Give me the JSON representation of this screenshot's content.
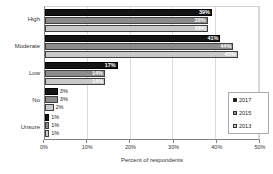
{
  "chart_data": {
    "type": "bar",
    "orientation": "horizontal",
    "title": "",
    "xlabel": "Percent of respondents",
    "ylabel": "",
    "xlim": [
      0,
      50
    ],
    "xticks": [
      "0%",
      "10%",
      "20%",
      "30%",
      "40%",
      "50%"
    ],
    "grid": true,
    "legend_position": "right",
    "value_suffix": "%",
    "inside_label_threshold": 6,
    "categories": [
      "High",
      "Moderate",
      "Low",
      "No",
      "Unsure"
    ],
    "series": [
      {
        "name": "2017",
        "color": "#141414",
        "border": "#000000",
        "label_color": "#ffffff",
        "values": [
          39,
          41,
          17,
          3,
          1
        ]
      },
      {
        "name": "2015",
        "color": "#8c8c8c",
        "border": "#3f3f3f",
        "label_color": "#ffffff",
        "values": [
          38,
          44,
          14,
          3,
          1
        ]
      },
      {
        "name": "2013",
        "color": "#c9c9c9",
        "border": "#3f3f3f",
        "label_color": "#ffffff",
        "values": [
          38,
          45,
          14,
          2,
          1
        ]
      }
    ]
  }
}
